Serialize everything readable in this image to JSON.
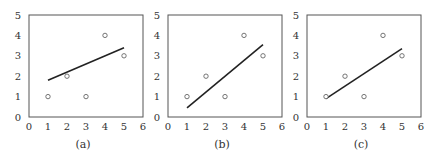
{
  "figure": {
    "panels": [
      {
        "caption": "(a)",
        "frame": {
          "left": 29,
          "top": 15,
          "right": 143,
          "bottom": 117
        }
      },
      {
        "caption": "(b)",
        "frame": {
          "left": 168,
          "top": 15,
          "right": 282,
          "bottom": 117
        }
      },
      {
        "caption": "(c)",
        "frame": {
          "left": 307,
          "top": 15,
          "right": 421,
          "bottom": 117
        }
      }
    ],
    "line_color": "#222222",
    "point_color": "#666666",
    "frame_color": "#555555"
  },
  "chart_data": [
    {
      "type": "scatter",
      "title": "(a)",
      "xlabel": "",
      "ylabel": "",
      "xlim": [
        0,
        6
      ],
      "ylim": [
        0,
        5
      ],
      "xticks": [
        0,
        1,
        2,
        3,
        4,
        5,
        6
      ],
      "yticks": [
        0,
        1,
        2,
        3,
        4,
        5
      ],
      "grid": false,
      "points": {
        "x": [
          1,
          2,
          3,
          4,
          5
        ],
        "y": [
          1,
          2,
          1,
          4,
          3
        ],
        "marker": "open-circle"
      },
      "line": {
        "x": [
          1,
          5
        ],
        "y": [
          1.8,
          3.4
        ]
      }
    },
    {
      "type": "scatter",
      "title": "(b)",
      "xlabel": "",
      "ylabel": "",
      "xlim": [
        0,
        6
      ],
      "ylim": [
        0,
        5
      ],
      "xticks": [
        0,
        1,
        2,
        3,
        4,
        5,
        6
      ],
      "yticks": [
        0,
        1,
        2,
        3,
        4,
        5
      ],
      "grid": false,
      "points": {
        "x": [
          1,
          2,
          3,
          4,
          5
        ],
        "y": [
          1,
          2,
          1,
          4,
          3
        ],
        "marker": "open-circle"
      },
      "line": {
        "x": [
          1,
          5
        ],
        "y": [
          0.45,
          3.55
        ]
      }
    },
    {
      "type": "scatter",
      "title": "(c)",
      "xlabel": "",
      "ylabel": "",
      "xlim": [
        0,
        6
      ],
      "ylim": [
        0,
        5
      ],
      "xticks": [
        0,
        1,
        2,
        3,
        4,
        5,
        6
      ],
      "yticks": [
        0,
        1,
        2,
        3,
        4,
        5
      ],
      "grid": false,
      "points": {
        "x": [
          1,
          2,
          3,
          4,
          5
        ],
        "y": [
          1,
          2,
          1,
          4,
          3
        ],
        "marker": "open-circle"
      },
      "line": {
        "x": [
          1,
          5
        ],
        "y": [
          0.9,
          3.35
        ]
      }
    }
  ]
}
